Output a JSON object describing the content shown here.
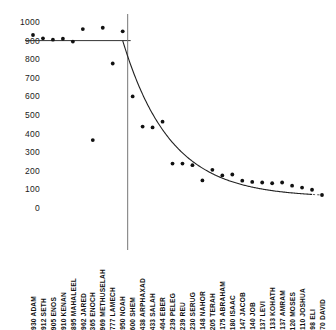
{
  "chart_data": {
    "type": "scatter",
    "title": "",
    "subtitle": "",
    "xlabel": "",
    "ylabel": "",
    "ylim": [
      0,
      1000
    ],
    "ytick_values": [
      1000,
      900,
      800,
      700,
      600,
      500,
      400,
      300,
      200,
      100,
      0
    ],
    "ytick_labels": [
      "1000",
      "900",
      "800",
      "700",
      "600",
      "500",
      "400",
      "300",
      "200",
      "100",
      "0"
    ],
    "grid": false,
    "legend": "none",
    "categories": [
      "ADAM",
      "SETH",
      "ENOS",
      "KENAN",
      "MAHALEEL",
      "JARED",
      "ENOCH",
      "METHUSELAH",
      "LAMECH",
      "NOAH",
      "SHEM",
      "ARPHAXAD",
      "SALAH",
      "EBER",
      "PELEG",
      "REU",
      "SERUG",
      "NAHOR",
      "TERAH",
      "ABRAHAM",
      "ISAAC",
      "JACOB",
      "JOB",
      "LEVI",
      "KOHATH",
      "AMRAM",
      "MOSES",
      "JOSHUA",
      "ELI",
      "DAVID"
    ],
    "values": [
      930,
      912,
      905,
      910,
      895,
      962,
      365,
      969,
      777,
      950,
      600,
      438,
      433,
      464,
      239,
      239,
      230,
      148,
      205,
      175,
      180,
      147,
      140,
      137,
      133,
      137,
      120,
      110,
      98,
      70
    ],
    "tick_labels": [
      "930 ADAM",
      "912 SETH",
      "905 ENOS",
      "910 KENAN",
      "895 MAHALEEL",
      "962 JARED",
      "365 ENOCH",
      "969 METHUSELAH",
      "777 LAMECH",
      "950 NOAH",
      "600 SHEM",
      "438 ARPHAXAD",
      "433 SALAH",
      "464 EBER",
      "239 PELEG",
      "239 REU",
      "230 SERUG",
      "148 NAHOR",
      "205 TERAH",
      "175 ABRAHAM",
      "180 ISAAC",
      "147 JACOB",
      "140 JOB",
      "137 LEVI",
      "133 KOHATH",
      "137 AMRAM",
      "120 MOSES",
      "110 JOSHUA",
      "98 ELI",
      "70 DAVID"
    ],
    "annotations": {
      "flood_divider_after": "NOAH",
      "preflood_level_line": 900,
      "trend_description": "flat plateau near 900 before the divider, sharp exponential decay after"
    },
    "series": [
      {
        "name": "lifespan-points",
        "marker": "filled-circle",
        "color": "#111111",
        "values": [
          930,
          912,
          905,
          910,
          895,
          962,
          365,
          969,
          777,
          950,
          600,
          438,
          433,
          464,
          239,
          239,
          230,
          148,
          205,
          175,
          180,
          147,
          140,
          137,
          133,
          137,
          120,
          110,
          98,
          70
        ]
      },
      {
        "name": "fitted-decay-curve",
        "marker": "line",
        "color": "#111111",
        "style": "solid-then-dashed"
      }
    ]
  },
  "colors": {
    "ink": "#111111",
    "axis": "#555555",
    "background": "#ffffff"
  }
}
